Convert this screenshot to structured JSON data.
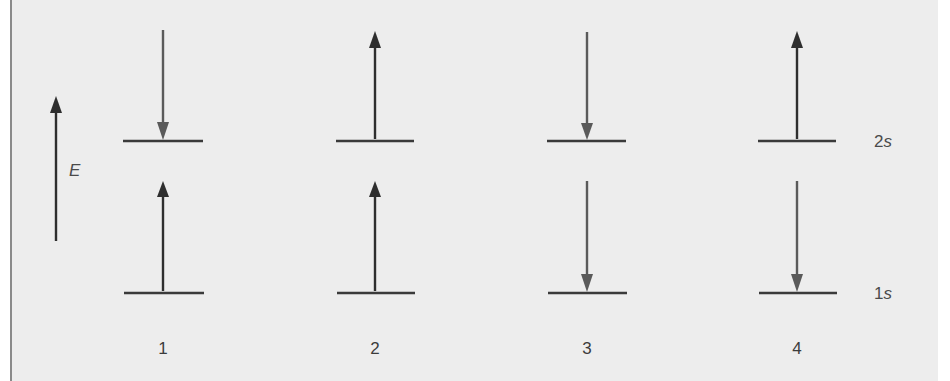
{
  "colors": {
    "background": "#ededed",
    "border": "#8a8a8a",
    "line": "#3a3a3a",
    "arrow_dark": "#2e2e2e",
    "arrow_mid": "#5a5a5a",
    "text": "#4a4a4a"
  },
  "energy_axis": {
    "label": "E",
    "direction": "up",
    "icon": "arrow-up-icon"
  },
  "levels": [
    {
      "id": "2s",
      "number": "2",
      "orbital": "s"
    },
    {
      "id": "1s",
      "number": "1",
      "orbital": "s"
    }
  ],
  "configurations": [
    {
      "label": "1",
      "level_2s_spin": "down",
      "level_1s_spin": "up"
    },
    {
      "label": "2",
      "level_2s_spin": "up",
      "level_1s_spin": "up"
    },
    {
      "label": "3",
      "level_2s_spin": "down",
      "level_1s_spin": "down"
    },
    {
      "label": "4",
      "level_2s_spin": "up",
      "level_1s_spin": "down"
    }
  ]
}
